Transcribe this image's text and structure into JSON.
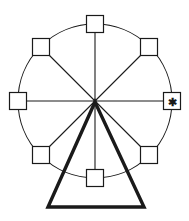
{
  "figure": {
    "background_color": "#ffffff",
    "line_color": "#1a1a1a",
    "width": 189,
    "height": 221
  },
  "wheel": {
    "label": "ferris-wheel",
    "center_x": 95,
    "center_y": 101,
    "radius": 77,
    "rim_stroke_width": 1.1,
    "spoke_count": 8,
    "spoke_stroke_width": 1.1
  },
  "cabins": {
    "count": 8,
    "size": 17,
    "fill_color": "#ffffff",
    "stroke_color": "#1a1a1a",
    "items": [
      {
        "name": "cabin-top",
        "angle_deg": 270,
        "cx": 95,
        "cy": 24,
        "marked": false,
        "marker": ""
      },
      {
        "name": "cabin-upper-right",
        "angle_deg": 315,
        "cx": 149,
        "cy": 47,
        "marked": false,
        "marker": ""
      },
      {
        "name": "cabin-right",
        "angle_deg": 0,
        "cx": 172,
        "cy": 101,
        "marked": true,
        "marker": "✱"
      },
      {
        "name": "cabin-lower-right",
        "angle_deg": 45,
        "cx": 149,
        "cy": 155,
        "marked": false,
        "marker": ""
      },
      {
        "name": "cabin-bottom",
        "angle_deg": 90,
        "cx": 95,
        "cy": 178,
        "marked": false,
        "marker": ""
      },
      {
        "name": "cabin-lower-left",
        "angle_deg": 135,
        "cx": 41,
        "cy": 155,
        "marked": false,
        "marker": ""
      },
      {
        "name": "cabin-left",
        "angle_deg": 180,
        "cx": 18,
        "cy": 101,
        "marked": false,
        "marker": ""
      },
      {
        "name": "cabin-upper-left",
        "angle_deg": 225,
        "cx": 41,
        "cy": 47,
        "marked": false,
        "marker": ""
      }
    ]
  },
  "support": {
    "name": "support-triangle",
    "stroke_width": 3.4,
    "apex_x": 95,
    "apex_y": 102,
    "base_left_x": 48,
    "base_right_x": 144,
    "base_y": 207
  },
  "marker": {
    "glyph": "✱",
    "description": "asterisk-marked-cabin",
    "color": "#1a1a1a"
  }
}
